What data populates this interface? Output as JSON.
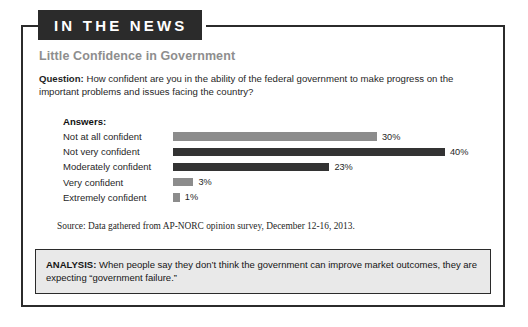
{
  "banner": {
    "label": "IN THE NEWS"
  },
  "article": {
    "title": "Little Confidence in Government",
    "question_label": "Question:",
    "question_text": " How confident are you in the ability of the federal government to make progress on the important problems and issues facing the country?",
    "answers_label": "Answers:",
    "source": "Source: Data gathered from AP-NORC opinion survey, December 12-16, 2013."
  },
  "analysis": {
    "label": "ANALYSIS:",
    "text": " When people say they don’t think the government can improve market outcomes, they are expecting “government failure.”"
  },
  "chart_data": {
    "type": "bar",
    "orientation": "horizontal",
    "title": "Little Confidence in Government",
    "xlabel": "",
    "ylabel": "",
    "xlim": [
      0,
      40
    ],
    "grid": false,
    "legend": "none",
    "categories": [
      "Not at all confident",
      "Not very confident",
      "Moderately confident",
      "Very confident",
      "Extremely confident"
    ],
    "values": [
      30,
      40,
      23,
      3,
      1
    ],
    "labels": [
      "30%",
      "40%",
      "23%",
      "3%",
      "1%"
    ],
    "colors": [
      "#8c8c8c",
      "#333333",
      "#333333",
      "#8c8c8c",
      "#8c8c8c"
    ],
    "px_per_unit": 6.8
  }
}
